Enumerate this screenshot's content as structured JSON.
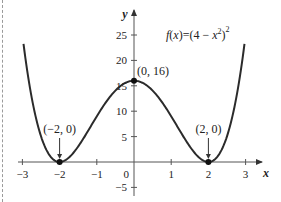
{
  "chart_data": {
    "type": "line",
    "title": "",
    "function_label": "f(x)=(4−x²)²",
    "function_label_parts": {
      "lhs": "f(x)",
      "eq": "=",
      "rhs_base": "(4 − x",
      "rhs_inner_exp": "2",
      "rhs_close": ")",
      "rhs_outer_exp": "2"
    },
    "xlabel": "x",
    "ylabel": "y",
    "xlim": [
      -3.3,
      3.5
    ],
    "ylim": [
      -5.5,
      30
    ],
    "x_ticks": [
      -3,
      -2,
      -1,
      0,
      1,
      2,
      3
    ],
    "x_tick_labels": [
      "−3",
      "−2",
      "−1",
      "0",
      "1",
      "2",
      "3"
    ],
    "y_ticks": [
      -5,
      5,
      10,
      15,
      20,
      25
    ],
    "y_tick_labels": [
      "−5",
      "5",
      "10",
      "15",
      "20",
      "25"
    ],
    "origin_label": "0",
    "grid": false,
    "legend": "none",
    "series": [
      {
        "name": "f(x) = (4 - x^2)^2",
        "x_range": [
          -2.97,
          2.97
        ],
        "x": [
          -2.97,
          -2.75,
          -2.5,
          -2.25,
          -2,
          -1.75,
          -1.5,
          -1,
          -0.5,
          0,
          0.5,
          1,
          1.5,
          1.75,
          2,
          2.25,
          2.5,
          2.75,
          2.97
        ],
        "y": [
          23.3,
          12.0,
          5.06,
          1.13,
          0,
          0.88,
          3.06,
          9,
          14.06,
          16,
          14.06,
          9,
          3.06,
          0.88,
          0,
          1.13,
          5.06,
          12.0,
          23.3
        ]
      }
    ],
    "marked_points": [
      {
        "x": -2,
        "y": 0,
        "label": "(−2, 0)",
        "arrow": true
      },
      {
        "x": 0,
        "y": 16,
        "label": "(0, 16)",
        "arrow": false
      },
      {
        "x": 2,
        "y": 0,
        "label": "(2, 0)",
        "arrow": true
      }
    ]
  },
  "colors": {
    "curve": "#2b2b2b",
    "axis": "#555555",
    "text": "#222222",
    "border": "#9a9a9a"
  }
}
